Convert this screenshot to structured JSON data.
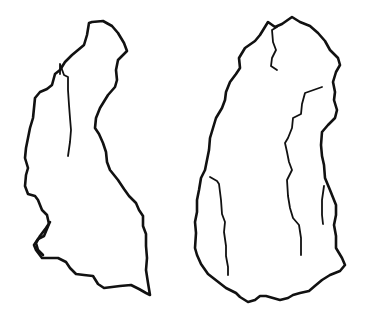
{
  "figure": {
    "background": "#ffffff",
    "stroke_color": "#111111",
    "objects": [
      {
        "id": "left-artifact",
        "label": ""
      },
      {
        "id": "right-artifact",
        "label": ""
      }
    ]
  }
}
